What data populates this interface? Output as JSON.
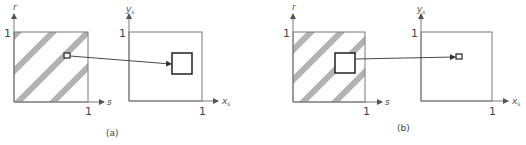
{
  "figure": {
    "panels": [
      {
        "id": "a",
        "caption": "(a)",
        "left_plot": {
          "x_axis_label": "s",
          "y_axis_label": "r",
          "x_tick": "1",
          "y_tick": "1",
          "pattern": "diagonal-stripes",
          "marked_region": "small"
        },
        "right_plot": {
          "x_axis_label": "x",
          "x_axis_subscript": "s",
          "y_axis_label": "y",
          "y_axis_subscript": "s",
          "x_tick": "1",
          "y_tick": "1",
          "marked_region": "large"
        }
      },
      {
        "id": "b",
        "caption": "(b)",
        "left_plot": {
          "x_axis_label": "s",
          "y_axis_label": "r",
          "x_tick": "1",
          "y_tick": "1",
          "pattern": "diagonal-stripes",
          "marked_region": "large"
        },
        "right_plot": {
          "x_axis_label": "x",
          "x_axis_subscript": "s",
          "y_axis_label": "y",
          "y_axis_subscript": "s",
          "x_tick": "1",
          "y_tick": "1",
          "marked_region": "small"
        }
      }
    ],
    "colors": {
      "axis": "#7a7a7a",
      "stripe": "#b3b3b3",
      "region_outline": "#222222",
      "arrow": "#333333"
    }
  }
}
